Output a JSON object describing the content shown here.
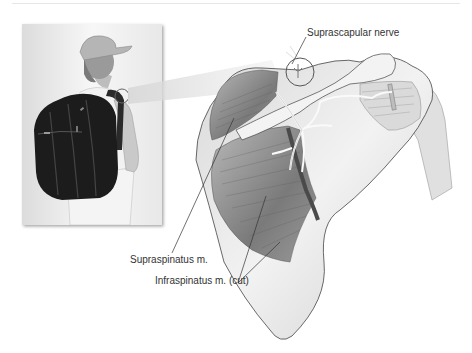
{
  "figure": {
    "inset": {
      "subject": "person wearing backpack, viewed from behind",
      "highlight": "circle over left shoulder strap"
    },
    "main": {
      "subject": "posterior view of right scapula and shoulder",
      "magnifier": "circle at suprascapular notch"
    },
    "labels": {
      "suprascapular_nerve": "Suprascapular nerve",
      "supraspinatus": "Supraspinatus m.",
      "infraspinatus": "Infraspinatus m. (cut)"
    },
    "colors": {
      "background": "#ffffff",
      "ink": "#333333",
      "bone_light": "#efefef",
      "muscle_dark": "#6a6a6a",
      "backpack": "#1c1c1c",
      "nerve": "#f5f5f5"
    }
  }
}
